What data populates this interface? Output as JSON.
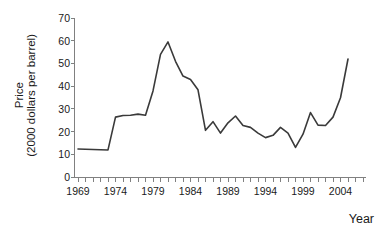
{
  "chart_data": {
    "type": "line",
    "title": "",
    "xlabel": "Year",
    "ylabel": "Price (2000 dollars per barrel)",
    "ylabel_lines": [
      "Price",
      "(2000 dollars per barrel)"
    ],
    "xlim": [
      1968,
      2006
    ],
    "ylim": [
      0,
      70
    ],
    "yticks": [
      0,
      10,
      20,
      30,
      40,
      50,
      60,
      70
    ],
    "ytick_labels": [
      "0",
      "10",
      "20",
      "30",
      "40",
      "50",
      "60",
      "70"
    ],
    "xticks": [
      1969,
      1974,
      1979,
      1984,
      1989,
      1994,
      1999,
      2004
    ],
    "xtick_labels": [
      "1969",
      "1974",
      "1979",
      "1984",
      "1989",
      "1994",
      "1999",
      "2004"
    ],
    "minor_xtick_interval": 1,
    "grid": false,
    "legend": "none",
    "line_color": "#3a3a3a",
    "line_width": 1.6,
    "x": [
      1969,
      1970,
      1971,
      1972,
      1973,
      1974,
      1975,
      1976,
      1977,
      1978,
      1979,
      1980,
      1981,
      1982,
      1983,
      1984,
      1985,
      1986,
      1987,
      1988,
      1989,
      1990,
      1991,
      1992,
      1993,
      1994,
      1995,
      1996,
      1997,
      1998,
      1999,
      2000,
      2001,
      2002,
      2003,
      2004,
      2005
    ],
    "values": [
      12.5,
      12.4,
      12.3,
      12.2,
      12.1,
      26.5,
      27.2,
      27.3,
      27.8,
      27.3,
      38.0,
      54.0,
      59.5,
      51.0,
      44.5,
      43.0,
      38.5,
      20.7,
      24.5,
      19.5,
      24.0,
      27.0,
      22.8,
      22.0,
      19.5,
      17.5,
      18.5,
      22.0,
      19.5,
      13.2,
      19.0,
      28.5,
      23.0,
      22.8,
      26.5,
      35.0,
      52.0
    ]
  }
}
